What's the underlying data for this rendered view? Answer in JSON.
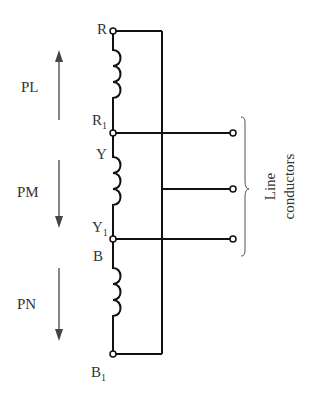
{
  "diagram": {
    "type": "three-phase winding connection",
    "nodes": {
      "R": "R",
      "R1_base": "R",
      "R1_sub": "1",
      "Y": "Y",
      "Y1_base": "Y",
      "Y1_sub": "1",
      "B": "B",
      "B1_base": "B",
      "B1_sub": "1"
    },
    "phases": [
      {
        "label": "PL",
        "arrow": "up"
      },
      {
        "label": "PM",
        "arrow": "down"
      },
      {
        "label": "PN",
        "arrow": "down"
      }
    ],
    "brace_label_line1": "Line",
    "brace_label_line2": "conductors",
    "colors": {
      "line": "#111111",
      "arrow": "#444444",
      "text": "#333333"
    }
  }
}
